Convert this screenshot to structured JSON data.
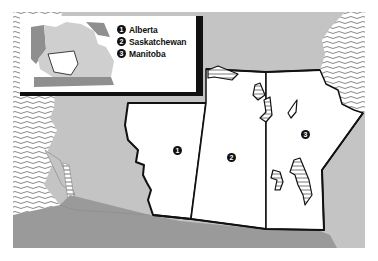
{
  "map": {
    "title": "Prairie Provinces of Canada",
    "colors": {
      "frame_border": "#8a8a8a",
      "land_light": "#c4c4c4",
      "land_dark": "#9a9a9a",
      "province_fill": "#ffffff",
      "province_stroke": "#111111",
      "water_hatch": "#6a6a6a",
      "inset_light": "#cfcfcf",
      "inset_dark": "#8f8f8f"
    },
    "legend": {
      "items": [
        {
          "number": "1",
          "label": "Alberta"
        },
        {
          "number": "2",
          "label": "Saskatchewan"
        },
        {
          "number": "3",
          "label": "Manitoba"
        }
      ]
    },
    "markers": [
      {
        "number": "1",
        "province": "Alberta"
      },
      {
        "number": "2",
        "province": "Saskatchewan"
      },
      {
        "number": "3",
        "province": "Manitoba"
      }
    ]
  }
}
